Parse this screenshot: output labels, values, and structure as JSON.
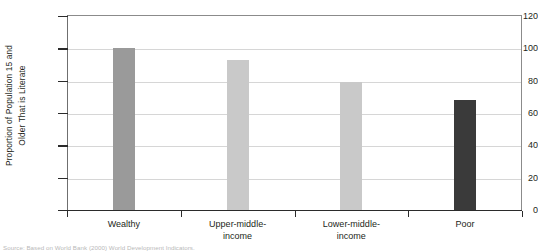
{
  "chart_data": {
    "type": "bar",
    "title": "",
    "subtitle": "",
    "xlabel": "",
    "ylabel_line1": "Proportion of Population 15 and",
    "ylabel_line2": "Older That is Literate",
    "categories": [
      {
        "line1": "Wealthy",
        "line2": ""
      },
      {
        "line1": "Upper-middle-",
        "line2": "income"
      },
      {
        "line1": "Lower-middle-",
        "line2": "income"
      },
      {
        "line1": "Poor",
        "line2": ""
      }
    ],
    "values": [
      100,
      93,
      79,
      68
    ],
    "bar_colors": [
      "#9a9a9a",
      "#c9c9c9",
      "#c9c9c9",
      "#3a3a3a"
    ],
    "ylim": [
      0,
      120
    ],
    "yticks": [
      0,
      20,
      40,
      60,
      80,
      100,
      120
    ],
    "ytick_labels": [
      "0",
      "20",
      "40",
      "60",
      "80",
      "100",
      "120"
    ],
    "grid": true,
    "grid_color": "#d6d6d6",
    "legend": "none",
    "legend_position": "none",
    "source_note": "Source: Based on World Bank (2000) World Development Indicators."
  },
  "colors": {
    "axis": "#2b2b2b",
    "frame": "#8b8b8b",
    "text": "#231f20",
    "grid": "#d6d6d6",
    "background": "#ffffff"
  }
}
